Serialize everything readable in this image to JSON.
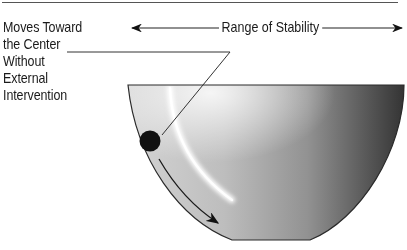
{
  "diagram": {
    "type": "stability-bowl",
    "annotation": {
      "lines": [
        "Moves Toward",
        "the Center",
        "Without",
        "External",
        "Intervention"
      ]
    },
    "range": {
      "label": "Range of Stability"
    },
    "elements": {
      "bowl": "half-bowl-gradient",
      "ball": "ball-on-slope",
      "motion_arrow": "arrow-toward-center",
      "highlight": "reflective-highlight"
    },
    "colors": {
      "line": "#2a2a2a",
      "ball": "#111111",
      "bowl_light": "#d8d8d8",
      "bowl_mid": "#9a9a9a",
      "bowl_dark": "#3a3a3a",
      "text": "#1a1a1a"
    }
  }
}
